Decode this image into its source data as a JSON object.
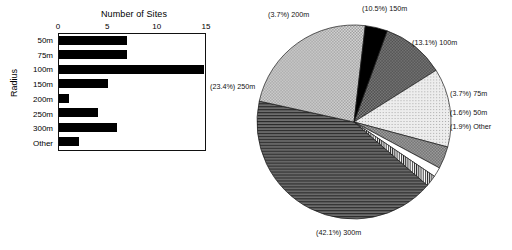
{
  "chart_data": [
    {
      "type": "bar",
      "title": "Number of Sites",
      "xlabel": "Number of Sites",
      "ylabel": "Radius",
      "orientation": "horizontal",
      "categories": [
        "50m",
        "75m",
        "100m",
        "150m",
        "200m",
        "250m",
        "300m",
        "Other"
      ],
      "values": [
        7,
        7,
        15,
        5,
        1,
        4,
        6,
        2
      ],
      "xticks": [
        "0",
        "5",
        "10",
        "15"
      ],
      "xlim": [
        0,
        15
      ],
      "grid": false,
      "legend": "none",
      "bar_color": "#000000"
    },
    {
      "type": "pie",
      "title": "",
      "labels": [
        "150m",
        "100m",
        "75m",
        "50m",
        "Other",
        "300m",
        "250m",
        "200m"
      ],
      "values": [
        10.5,
        13.1,
        3.7,
        1.6,
        1.9,
        42.1,
        23.4,
        3.7
      ],
      "annotations": [
        "(10.5%) 150m",
        "(13.1%) 100m",
        "(3.7%) 75m",
        "(1.6%) 50m",
        "(1.9%) Other",
        "(42.1%) 300m",
        "(23.4%) 250m",
        "(3.7%) 200m"
      ],
      "legend": "none",
      "slice_patterns": [
        "dark-checker",
        "light-dots",
        "mid-checker",
        "white",
        "vertical-lines",
        "horizontal-lines",
        "light-checker",
        "solid-black"
      ]
    }
  ],
  "bar_chart": {
    "title": "Number of Sites",
    "y_axis_title": "Radius",
    "x_ticks": [
      {
        "label": "0",
        "pos": 0
      },
      {
        "label": "5",
        "pos": 33.333
      },
      {
        "label": "10",
        "pos": 66.666
      },
      {
        "label": "15",
        "pos": 100
      }
    ],
    "rows": [
      {
        "label": "50m",
        "value": 7,
        "pct": 46.7
      },
      {
        "label": "75m",
        "value": 7,
        "pct": 46.7
      },
      {
        "label": "100m",
        "value": 15,
        "pct": 99.3
      },
      {
        "label": "150m",
        "value": 5,
        "pct": 33.3
      },
      {
        "label": "200m",
        "value": 1,
        "pct": 7.0
      },
      {
        "label": "250m",
        "value": 4,
        "pct": 26.7
      },
      {
        "label": "300m",
        "value": 6,
        "pct": 40.0
      },
      {
        "label": "Other",
        "value": 2,
        "pct": 14.0
      }
    ]
  },
  "pie_chart": {
    "labels": {
      "l200m": "(3.7%) 200m",
      "l150m": "(10.5%) 150m",
      "l100m": "(13.1%) 100m",
      "l75m": "(3.7%) 75m",
      "l50m": "(1.6%) 50m",
      "lother": "(1.9%) Other",
      "l250m": "(23.4%) 250m",
      "l300m": "(42.1%) 300m"
    },
    "slices": [
      {
        "name": "150m",
        "percent": 10.5
      },
      {
        "name": "100m",
        "percent": 13.1
      },
      {
        "name": "75m",
        "percent": 3.7
      },
      {
        "name": "50m",
        "percent": 1.6
      },
      {
        "name": "Other",
        "percent": 1.9
      },
      {
        "name": "300m",
        "percent": 42.1
      },
      {
        "name": "250m",
        "percent": 23.4
      },
      {
        "name": "200m",
        "percent": 3.7
      }
    ]
  }
}
